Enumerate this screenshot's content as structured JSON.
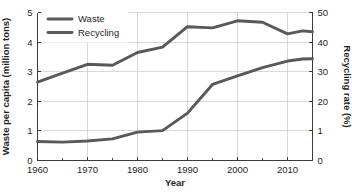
{
  "chart_data": {
    "type": "line",
    "title": "",
    "xlabel": "Year",
    "ylabel": "Waste per capita (million tons)",
    "y2label": "Recycling rate (%)",
    "xlim": [
      1960,
      2015
    ],
    "ylim": [
      0,
      5
    ],
    "y2lim": [
      0,
      50
    ],
    "grid": true,
    "legend_position": "top-left",
    "xticks": [
      1960,
      1970,
      1980,
      1990,
      2000,
      2010
    ],
    "xtick_labels": [
      "1960",
      "1970",
      "1980",
      "1990",
      "2000",
      "2010"
    ],
    "yticks": [
      0,
      1,
      2,
      3,
      4,
      5
    ],
    "ytick_labels": [
      "0",
      "1",
      "2",
      "3",
      "4",
      "5"
    ],
    "y2ticks": [
      0,
      10,
      20,
      30,
      40,
      50
    ],
    "y2tick_labels": [
      "0",
      "1",
      "20",
      "30",
      "40",
      "50"
    ],
    "series": [
      {
        "name": "Waste",
        "axis": "left",
        "color": "#595959",
        "x": [
          1960,
          1965,
          1970,
          1975,
          1980,
          1985,
          1990,
          1995,
          2000,
          2005,
          2010,
          2013,
          2015
        ],
        "values": [
          2.65,
          2.95,
          3.25,
          3.22,
          3.65,
          3.83,
          4.52,
          4.48,
          4.72,
          4.67,
          4.28,
          4.38,
          4.35
        ]
      },
      {
        "name": "Recycling",
        "axis": "right",
        "color": "#595959",
        "x": [
          1960,
          1965,
          1970,
          1975,
          1980,
          1985,
          1990,
          1995,
          2000,
          2005,
          2010,
          2013,
          2015
        ],
        "values": [
          6.4,
          6.2,
          6.6,
          7.3,
          9.6,
          10.1,
          16.0,
          25.7,
          28.6,
          31.4,
          33.6,
          34.3,
          34.4
        ]
      }
    ]
  },
  "legend": {
    "items": [
      {
        "label": "Waste",
        "color": "#595959"
      },
      {
        "label": "Recycling",
        "color": "#595959"
      }
    ]
  }
}
